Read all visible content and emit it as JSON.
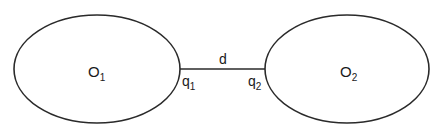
{
  "diagram": {
    "objects": [
      {
        "id": "O1",
        "label": "O",
        "subscript": "1",
        "point_label": "q",
        "point_subscript": "1"
      },
      {
        "id": "O2",
        "label": "O",
        "subscript": "2",
        "point_label": "q",
        "point_subscript": "2"
      }
    ],
    "connector": {
      "label": "d",
      "from": "q1",
      "to": "q2"
    },
    "colors": {
      "stroke": "#2a2a2a",
      "background": "#ffffff",
      "text": "#1a1a1a"
    }
  }
}
